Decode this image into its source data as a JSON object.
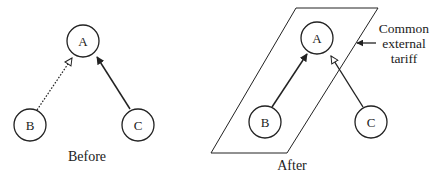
{
  "diagram": {
    "panels": [
      {
        "id": "before",
        "caption": "Before",
        "nodes": [
          {
            "id": "A",
            "label": "A"
          },
          {
            "id": "B",
            "label": "B"
          },
          {
            "id": "C",
            "label": "C"
          }
        ],
        "edges": [
          {
            "from": "B",
            "to": "A",
            "line": "dotted",
            "arrowhead": "hollow"
          },
          {
            "from": "C",
            "to": "A",
            "line": "solid",
            "arrowhead": "filled"
          }
        ]
      },
      {
        "id": "after",
        "caption": "After",
        "nodes": [
          {
            "id": "A",
            "label": "A"
          },
          {
            "id": "B",
            "label": "B"
          },
          {
            "id": "C",
            "label": "C"
          }
        ],
        "edges": [
          {
            "from": "B",
            "to": "A",
            "line": "solid",
            "arrowhead": "filled"
          },
          {
            "from": "C",
            "to": "A",
            "line": "solid",
            "arrowhead": "hollow"
          }
        ],
        "region": {
          "shape": "parallelogram",
          "encloses": [
            "A",
            "B"
          ],
          "label_lines": [
            "Common",
            "external",
            "tariff"
          ]
        }
      }
    ],
    "colors": {
      "stroke": "#222222",
      "background": "#ffffff"
    }
  }
}
